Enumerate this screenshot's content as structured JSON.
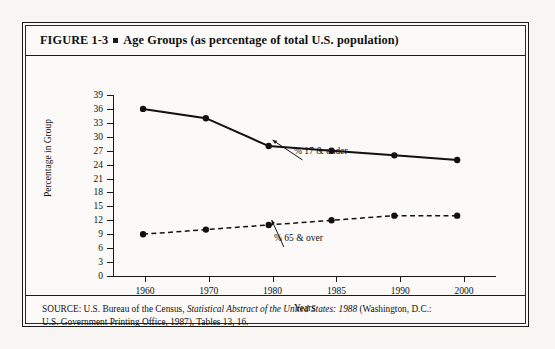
{
  "figure": {
    "title_prefix": "FIGURE 1-3",
    "title_text": "Age Groups (as percentage of total U.S. population)",
    "source_line_1_a": "SOURCE: U.S. Bureau of the Census, ",
    "source_line_1_italic": "Statistical Abstract of the United States: 1988",
    "source_line_1_b": " (Washington, D.C.:",
    "source_line_2": "U.S. Government Printing Office, 1987), Tables 13, 16."
  },
  "chart_data": {
    "type": "line",
    "title": "Age Groups (as percentage of total U.S. population)",
    "xlabel": "Years",
    "ylabel": "Percentage in Group",
    "categories": [
      "1960",
      "1970",
      "1980",
      "1985",
      "1990",
      "2000"
    ],
    "ylim": [
      0,
      39
    ],
    "yticks": [
      0,
      3,
      6,
      9,
      12,
      15,
      18,
      21,
      24,
      27,
      30,
      33,
      36,
      39
    ],
    "grid": false,
    "legend": "annotations",
    "series": [
      {
        "name": "% 17 & under",
        "style": "solid",
        "marker": "filled-circle",
        "color": "#111111",
        "values": [
          36,
          34,
          28,
          27,
          26,
          25
        ]
      },
      {
        "name": "% 65 & over",
        "style": "dashed",
        "marker": "filled-circle",
        "color": "#111111",
        "values": [
          9,
          10,
          11,
          12,
          13,
          13
        ]
      }
    ],
    "annotations": [
      {
        "text": "% 17 & under",
        "points_to": "1980"
      },
      {
        "text": "% 65 & over",
        "points_to": "1980"
      }
    ]
  }
}
